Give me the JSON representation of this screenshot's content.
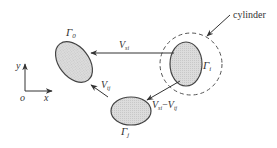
{
  "diagram": {
    "type": "schematic",
    "colors": {
      "stroke": "#444444",
      "fill": "#d9d9d9",
      "text": "#333333",
      "background": "#ffffff"
    },
    "bodies": [
      {
        "id": "gamma0",
        "label": "Γ",
        "sub": "0"
      },
      {
        "id": "gammai",
        "label": "Γ",
        "sub": "i"
      },
      {
        "id": "gammaj",
        "label": "Γ",
        "sub": "j"
      }
    ],
    "cylinder": {
      "label": "cylinder"
    },
    "arrows": [
      {
        "id": "v-si",
        "label": "V",
        "sub": "si"
      },
      {
        "id": "v-tj",
        "label": "V",
        "sub": "tj"
      },
      {
        "id": "v-si-minus-v-tj",
        "label_a": "V",
        "sub_a": "si",
        "minus": "−",
        "label_b": "V",
        "sub_b": "tj"
      }
    ],
    "axes": {
      "y": "y",
      "origin": "o",
      "x": "x"
    }
  }
}
